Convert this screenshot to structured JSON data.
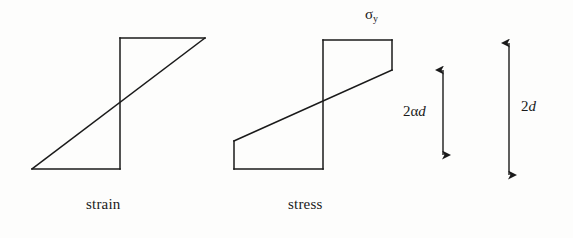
{
  "figure": {
    "background_color": "#fdfdfc",
    "line_color": "#1a1a1a",
    "captions": {
      "strain": "strain",
      "stress": "stress"
    },
    "labels": {
      "yield_stress_symbol": "σ",
      "yield_stress_subscript": "y",
      "dimension_inner_prefix": "2α",
      "dimension_inner_var": "d",
      "dimension_outer_prefix": "2",
      "dimension_outer_var": "d"
    },
    "strain_profile": {
      "name": "strain",
      "type": "piecewise-linear-antisymmetric",
      "description": "Linear strain distribution through the section depth: straight diagonal from bottom-left to top-right",
      "vertices": [
        {
          "x": 120,
          "y": 38
        },
        {
          "x": 205,
          "y": 38
        },
        {
          "x": 32,
          "y": 169
        },
        {
          "x": 120,
          "y": 169
        }
      ],
      "neutral_axis_x": 120,
      "top_y": 38,
      "bottom_y": 169
    },
    "stress_profile": {
      "name": "stress",
      "type": "elastic-plastic-clipped",
      "description": "Stress distribution clipped at the yield stress: flat plateaus top and bottom with an elastic linear core",
      "vertices": [
        {
          "x": 323,
          "y": 40
        },
        {
          "x": 392,
          "y": 40
        },
        {
          "x": 392,
          "y": 70
        },
        {
          "x": 234,
          "y": 141
        },
        {
          "x": 234,
          "y": 169
        },
        {
          "x": 323,
          "y": 169
        }
      ],
      "neutral_axis_x": 323,
      "top_y": 40,
      "bottom_y": 169,
      "elastic_core_top_y": 70,
      "elastic_core_bottom_y": 141
    },
    "dimensions": [
      {
        "name": "elastic-core-depth",
        "label_prefix": "2α",
        "label_var": "d",
        "arrow_x": 443,
        "arrow_top_y": 70,
        "arrow_bottom_y": 155
      },
      {
        "name": "section-depth",
        "label_prefix": "2",
        "label_var": "d",
        "arrow_x": 509,
        "arrow_top_y": 43,
        "arrow_bottom_y": 175
      }
    ]
  }
}
